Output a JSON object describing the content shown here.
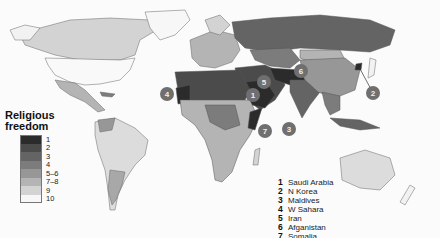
{
  "legend": {
    "title_line1": "Religious",
    "title_line2": "freedom",
    "items": [
      {
        "label": "1",
        "color": "#2b2b2b"
      },
      {
        "label": "2",
        "color": "#4b4b4b"
      },
      {
        "label": "3",
        "color": "#646464"
      },
      {
        "label": "4",
        "color": "#7c7c7c"
      },
      {
        "label": "5–6",
        "color": "#979797"
      },
      {
        "label": "7–8",
        "color": "#b4b4b4"
      },
      {
        "label": "9",
        "color": "#d3d3d3"
      },
      {
        "label": "10",
        "color": "#f7f7f7"
      }
    ]
  },
  "key": [
    {
      "num": "1",
      "name": "Saudi Arabia"
    },
    {
      "num": "2",
      "name": "N Korea"
    },
    {
      "num": "3",
      "name": "Maldives"
    },
    {
      "num": "4",
      "name": "W Sahara"
    },
    {
      "num": "5",
      "name": "Iran"
    },
    {
      "num": "6",
      "name": "Afganistan"
    },
    {
      "num": "7",
      "name": "Somalia"
    }
  ],
  "markers": [
    {
      "num": "1",
      "x": 253,
      "y": 95
    },
    {
      "num": "2",
      "x": 373,
      "y": 93
    },
    {
      "num": "3",
      "x": 289,
      "y": 129
    },
    {
      "num": "4",
      "x": 167,
      "y": 94
    },
    {
      "num": "5",
      "x": 264,
      "y": 82
    },
    {
      "num": "6",
      "x": 301,
      "y": 71
    },
    {
      "num": "7",
      "x": 265,
      "y": 131
    }
  ]
}
